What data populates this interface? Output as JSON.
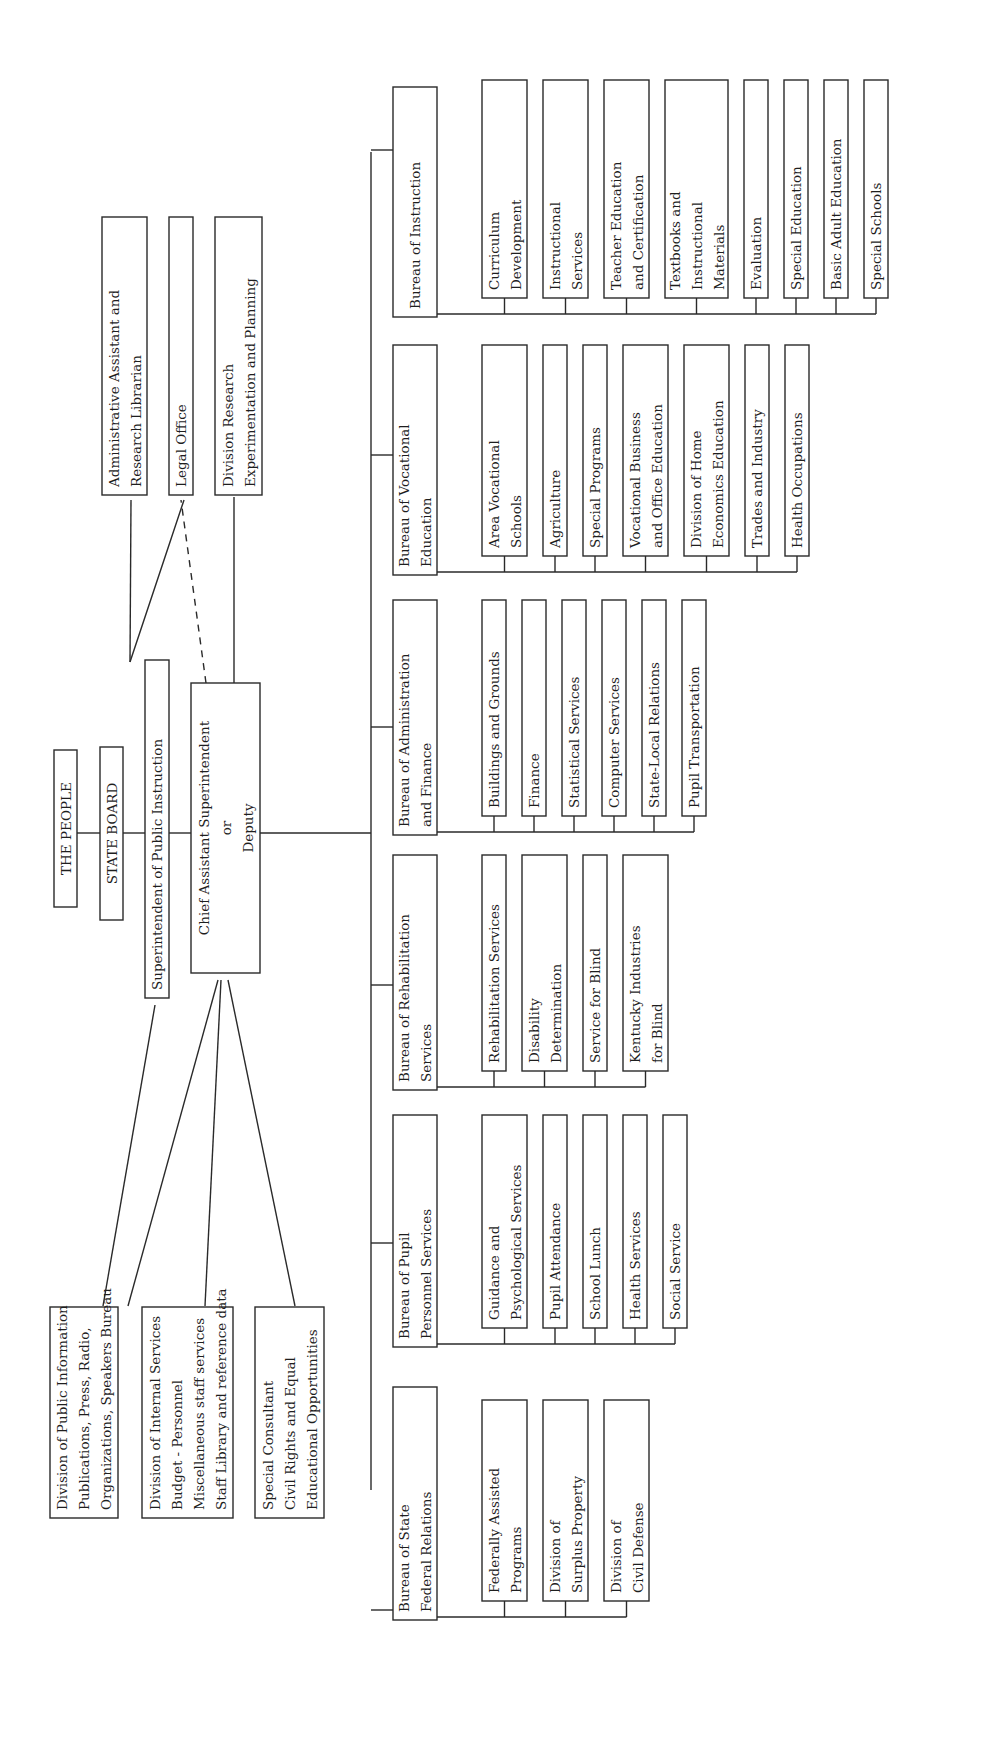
{
  "chart_data": {
    "type": "org-chart",
    "orientation": "rotated-90-ccw",
    "top_chain": [
      {
        "id": "people",
        "lines": [
          "THE PEOPLE"
        ]
      },
      {
        "id": "board",
        "lines": [
          "STATE BOARD"
        ]
      },
      {
        "id": "supt",
        "lines": [
          "Superintendent of Public Instruction"
        ]
      },
      {
        "id": "chief",
        "lines": [
          "Chief Assistant Superintendent",
          "or",
          "Deputy"
        ]
      }
    ],
    "superintendent_staff": [
      {
        "id": "admin",
        "lines": [
          "Administrative Assistant and",
          "Research Librarian"
        ],
        "link": "solid"
      },
      {
        "id": "legal",
        "lines": [
          "Legal Office"
        ],
        "link": "solid"
      },
      {
        "id": "research",
        "lines": [
          "Division Research",
          "Experimentation and Planning"
        ],
        "link": "solid"
      }
    ],
    "chief_links": {
      "legal": "dashed"
    },
    "staff_divisions": [
      {
        "id": "pubinfo",
        "lines": [
          "Division of Public Information",
          "Publications,  Press,  Radio,",
          "Organizations,  Speakers Bureau"
        ]
      },
      {
        "id": "internal",
        "lines": [
          "Division of Internal Services",
          "Budget - Personnel",
          "Miscellaneous staff services",
          "Staff Library and reference data"
        ]
      },
      {
        "id": "consultant",
        "lines": [
          "Special Consultant",
          "Civil Rights and Equal",
          "Educational Opportunities"
        ]
      }
    ],
    "bureaus": [
      {
        "id": "instruction",
        "lines": [
          "Bureau of Instruction"
        ],
        "units": [
          [
            "Curriculum",
            "Development"
          ],
          [
            "Instructional",
            "Services"
          ],
          [
            "Teacher Education",
            "and Certification"
          ],
          [
            "Textbooks and",
            "Instructional",
            "Materials"
          ],
          [
            "Evaluation"
          ],
          [
            "Special Education"
          ],
          [
            "Basic Adult Education"
          ],
          [
            "Special Schools"
          ]
        ]
      },
      {
        "id": "vocational",
        "lines": [
          "Bureau of Vocational",
          "Education"
        ],
        "units": [
          [
            "Area Vocational",
            "Schools"
          ],
          [
            "Agriculture"
          ],
          [
            "Special Programs"
          ],
          [
            "Vocational Business",
            "and Office Education"
          ],
          [
            "Division of Home",
            "Economics Education"
          ],
          [
            "Trades and Industry"
          ],
          [
            "Health Occupations"
          ]
        ]
      },
      {
        "id": "admin_finance",
        "lines": [
          "Bureau of Administration",
          "and Finance"
        ],
        "units": [
          [
            "Buildings and Grounds"
          ],
          [
            "Finance"
          ],
          [
            "Statistical Services"
          ],
          [
            "Computer Services"
          ],
          [
            "State-Local Relations"
          ],
          [
            "Pupil Transportation"
          ]
        ]
      },
      {
        "id": "rehab",
        "lines": [
          "Bureau of Rehabilitation",
          "Services"
        ],
        "units": [
          [
            "Rehabilitation Services"
          ],
          [
            "Disability",
            "Determination"
          ],
          [
            "Service for Blind"
          ],
          [
            "Kentucky Industries",
            "for Blind"
          ]
        ]
      },
      {
        "id": "pupil",
        "lines": [
          "Bureau of Pupil",
          "Personnel Services"
        ],
        "units": [
          [
            "Guidance and",
            "Psychological Services"
          ],
          [
            "Pupil Attendance"
          ],
          [
            "School Lunch"
          ],
          [
            "Health Services"
          ],
          [
            "Social Service"
          ]
        ]
      },
      {
        "id": "federal",
        "lines": [
          "Bureau  of State",
          "Federal Relations"
        ],
        "units": [
          [
            "Federally Assisted",
            "Programs"
          ],
          [
            "Division of",
            "Surplus Property"
          ],
          [
            "Division of",
            "Civil Defense"
          ]
        ]
      }
    ]
  },
  "colors": {
    "ink": "#2a2a2a",
    "paper": "#ffffff"
  }
}
